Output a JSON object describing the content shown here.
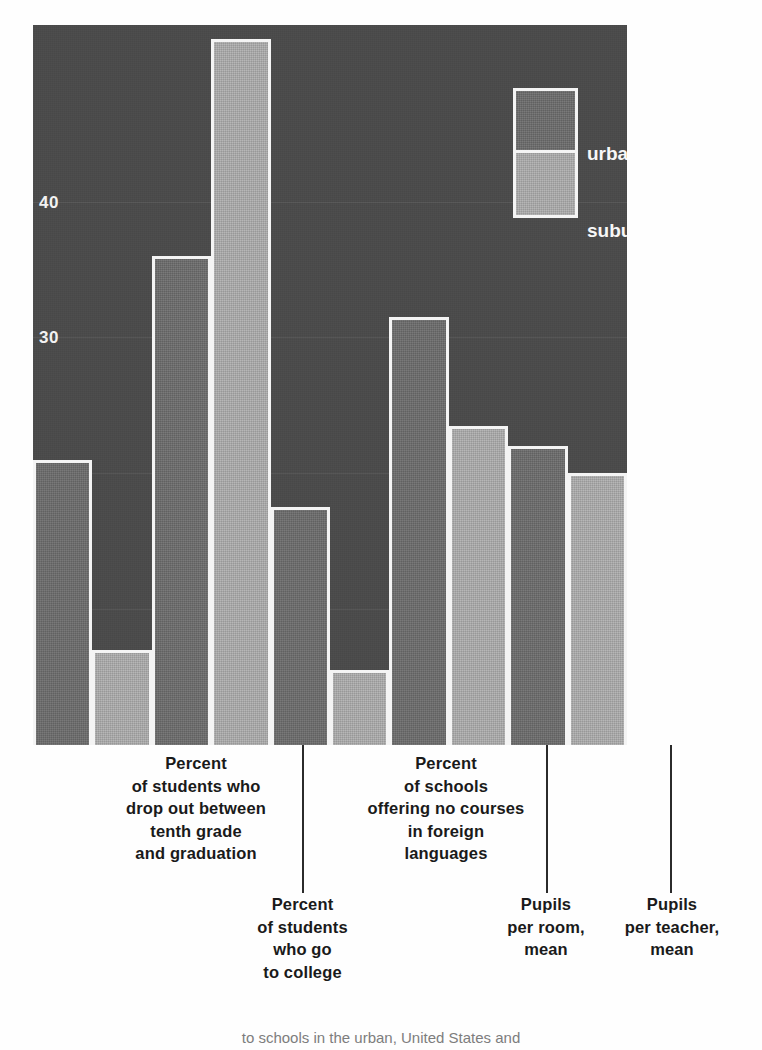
{
  "chart_data": {
    "type": "bar",
    "title": "",
    "subtitle": "",
    "xlabel": "",
    "ylabel": "",
    "ylim": [
      0,
      53
    ],
    "grid": true,
    "legend_position": "top-right",
    "yticks": [
      10,
      20,
      30,
      40
    ],
    "categories": [
      "Percent\nof students who\ndrop out between\ntenth grade\nand graduation",
      "Percent\nof students\nwho go\nto college",
      "Percent\nof schools\noffering no courses\nin foreign\nlanguages",
      "Pupils\nper room,\nmean",
      "Pupils\nper teacher,\nmean"
    ],
    "series": [
      {
        "name": "urban",
        "color": "#6b6b6b",
        "values": [
          21.0,
          36.0,
          17.5,
          31.5,
          22.0
        ]
      },
      {
        "name": "suburban",
        "color": "#ababab",
        "values": [
          7.0,
          52.0,
          5.5,
          23.5,
          20.0
        ]
      }
    ],
    "annotations": []
  },
  "legend": {
    "urban_label": "urban",
    "suburban_label": "suburban"
  },
  "axis": {
    "tick_40": "40",
    "tick_30": "30",
    "tick_20": "20",
    "tick_10": "10"
  },
  "categories": {
    "c0": "Percent\nof students who\ndrop out between\ntenth grade\nand graduation",
    "c1": "Percent\nof students\nwho go\nto college",
    "c2": "Percent\nof schools\noffering no courses\nin foreign\nlanguages",
    "c3": "Pupils\nper room,\nmean",
    "c4": "Pupils\nper teacher,\nmean"
  },
  "footer": {
    "caption": "to schools in the urban, United States and"
  },
  "colors": {
    "plot_background": "#4a4a4a",
    "urban_bar": "#6b6b6b",
    "suburban_bar": "#ababab",
    "bar_outline": "#f4f4f4",
    "tick_text": "#f2f2f2",
    "label_text": "#1a1a1a"
  }
}
